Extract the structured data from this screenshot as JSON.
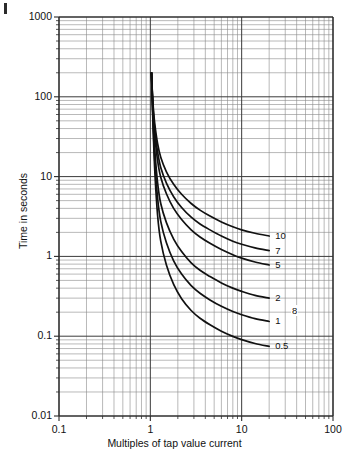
{
  "figure": {
    "corner_mark": "page-margin-mark",
    "stray_label": "8"
  },
  "chart_data": {
    "type": "line",
    "title": "",
    "xlabel": "Multiples of tap value current",
    "ylabel": "Time in seconds",
    "xscale": "log",
    "yscale": "log",
    "xlim": [
      0.1,
      100
    ],
    "ylim": [
      0.01,
      1000
    ],
    "grid": true,
    "legend_position": "inline-right-end-labels",
    "x_ticks": [
      "0.1",
      "1",
      "10",
      "100"
    ],
    "x_tick_values": [
      0.1,
      1,
      10,
      100
    ],
    "y_ticks": [
      "0.01",
      "0.1",
      "1",
      "10",
      "100",
      "1000"
    ],
    "y_tick_values": [
      0.01,
      0.1,
      1,
      10,
      100,
      1000
    ],
    "series": [
      {
        "name": "10",
        "label": "10",
        "x": [
          1.03,
          1.05,
          1.08,
          1.12,
          1.2,
          1.3,
          1.5,
          1.8,
          2.2,
          2.8,
          3.5,
          4.5,
          6,
          8,
          10,
          14,
          20
        ],
        "y": [
          200,
          120,
          70,
          45,
          26,
          17.5,
          11.5,
          8.0,
          6.0,
          4.6,
          3.8,
          3.2,
          2.7,
          2.35,
          2.15,
          1.95,
          1.8
        ]
      },
      {
        "name": "7",
        "label": "7",
        "x": [
          1.03,
          1.05,
          1.08,
          1.12,
          1.2,
          1.3,
          1.5,
          1.8,
          2.2,
          2.8,
          3.5,
          4.5,
          6,
          8,
          10,
          14,
          20
        ],
        "y": [
          200,
          115,
          62,
          38,
          20.5,
          13.0,
          8.3,
          5.6,
          4.1,
          3.1,
          2.55,
          2.15,
          1.8,
          1.55,
          1.42,
          1.28,
          1.18
        ]
      },
      {
        "name": "5",
        "label": "5",
        "x": [
          1.03,
          1.05,
          1.08,
          1.12,
          1.2,
          1.3,
          1.5,
          1.8,
          2.2,
          2.8,
          3.5,
          4.5,
          6,
          8,
          10,
          14,
          20
        ],
        "y": [
          200,
          110,
          56,
          32,
          16.0,
          9.8,
          6.1,
          4.0,
          2.9,
          2.15,
          1.75,
          1.46,
          1.22,
          1.05,
          0.95,
          0.85,
          0.78
        ]
      },
      {
        "name": "2",
        "label": "2",
        "x": [
          1.03,
          1.05,
          1.08,
          1.12,
          1.2,
          1.3,
          1.5,
          1.8,
          2.2,
          2.8,
          3.5,
          4.5,
          6,
          8,
          10,
          14,
          20
        ],
        "y": [
          200,
          100,
          44,
          21.0,
          8.4,
          4.6,
          2.65,
          1.65,
          1.15,
          0.83,
          0.67,
          0.56,
          0.465,
          0.4,
          0.365,
          0.325,
          0.3
        ]
      },
      {
        "name": "1",
        "label": "1",
        "x": [
          1.03,
          1.05,
          1.08,
          1.12,
          1.2,
          1.3,
          1.5,
          1.8,
          2.2,
          2.8,
          3.5,
          4.5,
          6,
          8,
          10,
          14,
          20
        ],
        "y": [
          200,
          95,
          38,
          15.5,
          5.4,
          2.75,
          1.48,
          0.88,
          0.6,
          0.43,
          0.345,
          0.285,
          0.237,
          0.204,
          0.186,
          0.166,
          0.153
        ]
      },
      {
        "name": "0.5",
        "label": "0.5",
        "x": [
          1.03,
          1.05,
          1.08,
          1.12,
          1.2,
          1.3,
          1.5,
          1.8,
          2.2,
          2.8,
          3.5,
          4.5,
          6,
          8,
          10,
          14,
          20
        ],
        "y": [
          200,
          90,
          33,
          11.5,
          3.3,
          1.55,
          0.78,
          0.445,
          0.295,
          0.21,
          0.168,
          0.139,
          0.1155,
          0.0995,
          0.0905,
          0.081,
          0.0745
        ]
      }
    ],
    "annotations": [
      {
        "text": "10",
        "series": "10"
      },
      {
        "text": "7",
        "series": "7"
      },
      {
        "text": "5",
        "series": "5"
      },
      {
        "text": "2",
        "series": "2"
      },
      {
        "text": "1",
        "series": "1"
      },
      {
        "text": "0.5",
        "series": "0.5"
      }
    ]
  }
}
